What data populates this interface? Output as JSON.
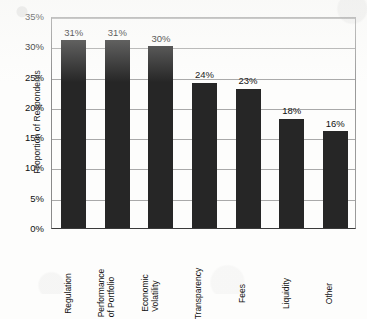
{
  "chart_data": {
    "type": "bar",
    "title": "",
    "subtitle": "",
    "xlabel": "",
    "ylabel": "Proportion of Respondents",
    "ylim": [
      0,
      35
    ],
    "y_tick_step": 5,
    "y_ticks": [
      "0%",
      "5%",
      "10%",
      "15%",
      "20%",
      "25%",
      "30%",
      "35%"
    ],
    "y_tick_values": [
      0,
      5,
      10,
      15,
      20,
      25,
      30,
      35
    ],
    "grid": "horizontal",
    "legend": "none",
    "value_label_suffix": "%",
    "categories": [
      "Regulation",
      "Performance of Portfolio",
      "Economic Volatility",
      "Transparency",
      "Fees",
      "Liquidity",
      "Other"
    ],
    "category_label_lines": [
      [
        "Regulation"
      ],
      [
        "Performance",
        "of Portfolio"
      ],
      [
        "Economic",
        "Volatility"
      ],
      [
        "Transparency"
      ],
      [
        "Fees"
      ],
      [
        "Liquidity"
      ],
      [
        "Other"
      ]
    ],
    "values": [
      31,
      31,
      30,
      24,
      23,
      18,
      16
    ],
    "value_labels": [
      "31%",
      "31%",
      "30%",
      "24%",
      "23%",
      "18%",
      "16%"
    ],
    "colors": {
      "bar": "#262626",
      "gridline": "#a9a9a9",
      "axis": "#3a3a3a",
      "text": "#111111",
      "background": "#fdfdfc"
    }
  }
}
